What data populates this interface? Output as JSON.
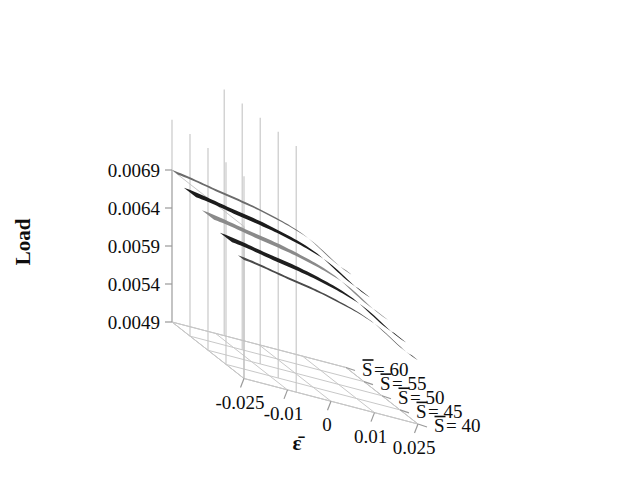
{
  "chart_data": {
    "type": "line",
    "title": "",
    "subtitle": "",
    "projection": "3d-ribbon-surface",
    "xlabel": "ε̄",
    "ylabel": "Load",
    "zlabel": "",
    "x": [
      -0.025,
      -0.01,
      0,
      0.01,
      0.025
    ],
    "xtick_labels": [
      "-0.025",
      "-0.01",
      "0",
      "0.01",
      "0.025"
    ],
    "ytick_labels": [
      "0.0069",
      "0.0064",
      "0.0059",
      "0.0054",
      "0.0049"
    ],
    "ytick_values": [
      0.0069,
      0.0064,
      0.0059,
      0.0054,
      0.0049
    ],
    "ylim": [
      0.0049,
      0.0069
    ],
    "ztick_labels": [
      "S̄= 60",
      "S̄= 55",
      "S̄= 50",
      "S̄= 45",
      "S̄= 40"
    ],
    "z": [
      60,
      55,
      50,
      45,
      40
    ],
    "grid": true,
    "legend": "none",
    "series": [
      {
        "name": "S̄= 60",
        "z": 60,
        "color": "#6b6b6b",
        "values": [
          0.0069,
          0.0068,
          0.00669,
          0.00651,
          0.00618
        ]
      },
      {
        "name": "S̄= 55",
        "z": 55,
        "color": "#1c1c1c",
        "values": [
          0.00679,
          0.00669,
          0.00658,
          0.0064,
          0.00607
        ]
      },
      {
        "name": "S̄= 50",
        "z": 50,
        "color": "#8a8a8a",
        "values": [
          0.00668,
          0.00658,
          0.00647,
          0.00629,
          0.00596
        ]
      },
      {
        "name": "S̄= 45",
        "z": 45,
        "color": "#1f1f1f",
        "values": [
          0.00657,
          0.00647,
          0.00636,
          0.00618,
          0.00585
        ]
      },
      {
        "name": "S̄= 40",
        "z": 40,
        "color": "#4a4a4a",
        "values": [
          0.00646,
          0.00636,
          0.00625,
          0.00607,
          0.00574
        ]
      }
    ]
  },
  "axes": {
    "y_title": "Load",
    "x_title": "ε̄",
    "y_ticks": [
      {
        "label": "0.0069"
      },
      {
        "label": "0.0064"
      },
      {
        "label": "0.0059"
      },
      {
        "label": "0.0054"
      },
      {
        "label": "0.0049"
      }
    ],
    "x_ticks": [
      {
        "label": "-0.025"
      },
      {
        "label": "-0.01"
      },
      {
        "label": "0"
      },
      {
        "label": "0.01"
      },
      {
        "label": "0.025"
      }
    ],
    "z_ticks": [
      {
        "label_base": "S",
        "label_rest": "= 60"
      },
      {
        "label_base": "S",
        "label_rest": "= 55"
      },
      {
        "label_base": "S",
        "label_rest": "= 50"
      },
      {
        "label_base": "S",
        "label_rest": "= 45"
      },
      {
        "label_base": "S",
        "label_rest": "= 40"
      }
    ]
  },
  "style": {
    "background": "#ffffff",
    "axis_color": "#b9b9b9",
    "grid_color": "#c8c8c8",
    "text_color": "#0d0d0d"
  }
}
